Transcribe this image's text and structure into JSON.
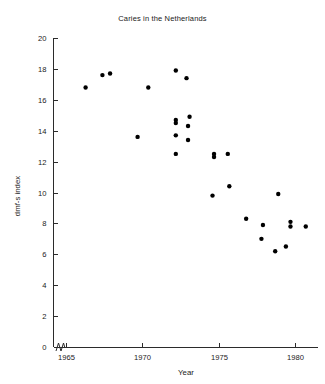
{
  "chart_data": {
    "type": "scatter",
    "title": "Caries in the Netherlands",
    "xlabel": "Year",
    "ylabel": "dmf-s index",
    "xlim": [
      1964.2,
      1981.5
    ],
    "ylim": [
      0,
      20
    ],
    "xticks": [
      1965,
      1970,
      1975,
      1980
    ],
    "xtick_labels": [
      "1965",
      "1970",
      "1975",
      "1980"
    ],
    "yticks": [
      0,
      2,
      4,
      6,
      8,
      10,
      12,
      14,
      16,
      18,
      20
    ],
    "ytick_labels": [
      "0",
      "2",
      "4",
      "6",
      "8",
      "10",
      "12",
      "14",
      "16",
      "18",
      "20"
    ],
    "grid": false,
    "legend": false,
    "axis_break": "x-axis and y-axis origin break",
    "marker": "filled-circle",
    "marker_color": "#000000",
    "points": [
      {
        "x": 1966.3,
        "y": 16.8
      },
      {
        "x": 1967.4,
        "y": 17.6
      },
      {
        "x": 1967.9,
        "y": 17.7
      },
      {
        "x": 1969.7,
        "y": 13.6
      },
      {
        "x": 1970.4,
        "y": 16.8
      },
      {
        "x": 1972.2,
        "y": 17.9
      },
      {
        "x": 1972.9,
        "y": 17.4
      },
      {
        "x": 1972.2,
        "y": 14.7
      },
      {
        "x": 1972.2,
        "y": 14.5
      },
      {
        "x": 1973.1,
        "y": 14.9
      },
      {
        "x": 1973.0,
        "y": 14.3
      },
      {
        "x": 1972.2,
        "y": 13.7
      },
      {
        "x": 1973.0,
        "y": 13.4
      },
      {
        "x": 1972.2,
        "y": 12.5
      },
      {
        "x": 1974.7,
        "y": 12.5
      },
      {
        "x": 1974.7,
        "y": 12.3
      },
      {
        "x": 1975.6,
        "y": 12.5
      },
      {
        "x": 1975.7,
        "y": 10.4
      },
      {
        "x": 1974.6,
        "y": 9.8
      },
      {
        "x": 1978.9,
        "y": 9.9
      },
      {
        "x": 1976.8,
        "y": 8.3
      },
      {
        "x": 1977.9,
        "y": 7.9
      },
      {
        "x": 1979.7,
        "y": 8.1
      },
      {
        "x": 1979.7,
        "y": 7.8
      },
      {
        "x": 1980.7,
        "y": 7.8
      },
      {
        "x": 1977.8,
        "y": 7.0
      },
      {
        "x": 1979.4,
        "y": 6.5
      },
      {
        "x": 1978.7,
        "y": 6.2
      }
    ]
  }
}
